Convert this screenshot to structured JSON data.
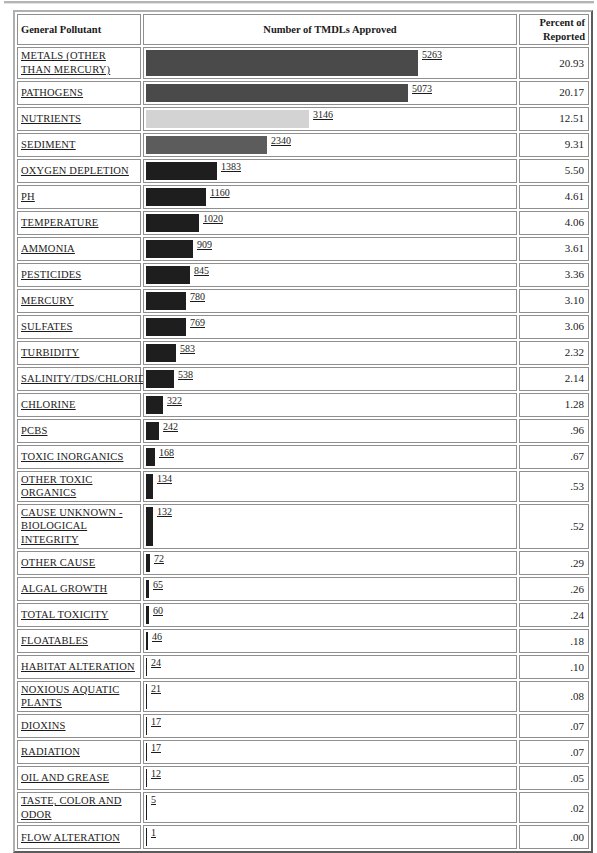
{
  "header": {
    "col_pollutant": "General Pollutant",
    "col_bars": "Number of TMDLs Approved",
    "col_percent": "Percent of Reported"
  },
  "chart_data": {
    "type": "bar",
    "orientation": "horizontal",
    "title": "Number of TMDLs Approved",
    "columns": [
      "General Pollutant",
      "Number of TMDLs Approved",
      "Percent of Reported"
    ],
    "xlim": [
      0,
      5263
    ],
    "grid": false,
    "legend": "none",
    "rows": [
      {
        "pollutant": "METALS (OTHER THAN MERCURY)",
        "tmdls": 5263,
        "percent": "20.93",
        "bar_color": "#4a4a4a"
      },
      {
        "pollutant": "PATHOGENS",
        "tmdls": 5073,
        "percent": "20.17",
        "bar_color": "#4a4a4a"
      },
      {
        "pollutant": "NUTRIENTS",
        "tmdls": 3146,
        "percent": "12.51",
        "bar_color": "#d3d3d3"
      },
      {
        "pollutant": "SEDIMENT",
        "tmdls": 2340,
        "percent": "9.31",
        "bar_color": "#5c5c5c"
      },
      {
        "pollutant": "OXYGEN DEPLETION",
        "tmdls": 1383,
        "percent": "5.50",
        "bar_color": "#1e1e1e"
      },
      {
        "pollutant": "PH",
        "tmdls": 1160,
        "percent": "4.61",
        "bar_color": "#1e1e1e"
      },
      {
        "pollutant": "TEMPERATURE",
        "tmdls": 1020,
        "percent": "4.06",
        "bar_color": "#1e1e1e"
      },
      {
        "pollutant": "AMMONIA",
        "tmdls": 909,
        "percent": "3.61",
        "bar_color": "#1e1e1e"
      },
      {
        "pollutant": "PESTICIDES",
        "tmdls": 845,
        "percent": "3.36",
        "bar_color": "#1e1e1e"
      },
      {
        "pollutant": "MERCURY",
        "tmdls": 780,
        "percent": "3.10",
        "bar_color": "#1e1e1e"
      },
      {
        "pollutant": "SULFATES",
        "tmdls": 769,
        "percent": "3.06",
        "bar_color": "#1e1e1e"
      },
      {
        "pollutant": "TURBIDITY",
        "tmdls": 583,
        "percent": "2.32",
        "bar_color": "#1e1e1e"
      },
      {
        "pollutant": "SALINITY/TDS/CHLORIDES",
        "tmdls": 538,
        "percent": "2.14",
        "bar_color": "#1e1e1e"
      },
      {
        "pollutant": "CHLORINE",
        "tmdls": 322,
        "percent": "1.28",
        "bar_color": "#1e1e1e"
      },
      {
        "pollutant": "PCBS",
        "tmdls": 242,
        "percent": ".96",
        "bar_color": "#1e1e1e"
      },
      {
        "pollutant": "TOXIC INORGANICS",
        "tmdls": 168,
        "percent": ".67",
        "bar_color": "#1e1e1e"
      },
      {
        "pollutant": "OTHER TOXIC ORGANICS",
        "tmdls": 134,
        "percent": ".53",
        "bar_color": "#1e1e1e"
      },
      {
        "pollutant": "CAUSE UNKNOWN - BIOLOGICAL INTEGRITY",
        "tmdls": 132,
        "percent": ".52",
        "bar_color": "#1e1e1e"
      },
      {
        "pollutant": "OTHER CAUSE",
        "tmdls": 72,
        "percent": ".29",
        "bar_color": "#1e1e1e"
      },
      {
        "pollutant": "ALGAL GROWTH",
        "tmdls": 65,
        "percent": ".26",
        "bar_color": "#1e1e1e"
      },
      {
        "pollutant": "TOTAL TOXICITY",
        "tmdls": 60,
        "percent": ".24",
        "bar_color": "#1e1e1e"
      },
      {
        "pollutant": "FLOATABLES",
        "tmdls": 46,
        "percent": ".18",
        "bar_color": "#1e1e1e"
      },
      {
        "pollutant": "HABITAT ALTERATION",
        "tmdls": 24,
        "percent": ".10",
        "bar_color": "#1e1e1e"
      },
      {
        "pollutant": "NOXIOUS AQUATIC PLANTS",
        "tmdls": 21,
        "percent": ".08",
        "bar_color": "#1e1e1e"
      },
      {
        "pollutant": "DIOXINS",
        "tmdls": 17,
        "percent": ".07",
        "bar_color": "#1e1e1e"
      },
      {
        "pollutant": "RADIATION",
        "tmdls": 17,
        "percent": ".07",
        "bar_color": "#1e1e1e"
      },
      {
        "pollutant": "OIL AND GREASE",
        "tmdls": 12,
        "percent": ".05",
        "bar_color": "#1e1e1e"
      },
      {
        "pollutant": "TASTE, COLOR AND ODOR",
        "tmdls": 5,
        "percent": ".02",
        "bar_color": "#1e1e1e"
      },
      {
        "pollutant": "FLOW ALTERATION",
        "tmdls": 1,
        "percent": ".00",
        "bar_color": "#1e1e1e"
      }
    ]
  }
}
